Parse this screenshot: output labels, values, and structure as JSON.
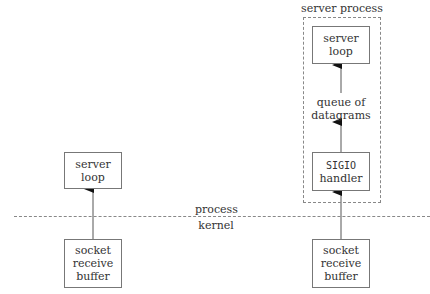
{
  "diagram": {
    "separator": {
      "upper_label": "process",
      "lower_label": "kernel"
    },
    "left": {
      "server_loop": {
        "line1": "server",
        "line2": "loop"
      },
      "socket_buffer": {
        "line1": "socket",
        "line2": "receive",
        "line3": "buffer"
      }
    },
    "right": {
      "group_label": "server process",
      "server_loop": {
        "line1": "server",
        "line2": "loop"
      },
      "queue": {
        "line1": "queue of",
        "line2": "datagrams"
      },
      "handler": {
        "line1": "SIGIO",
        "line2": "handler"
      },
      "socket_buffer": {
        "line1": "socket",
        "line2": "receive",
        "line3": "buffer"
      }
    }
  }
}
